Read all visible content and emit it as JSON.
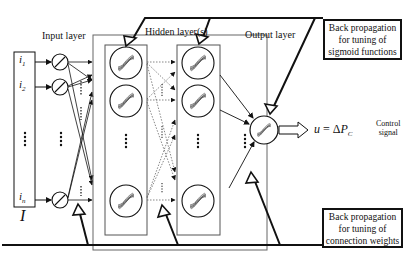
{
  "diagram": {
    "type": "neural-network-architecture",
    "layers": {
      "input_label": "Input layer",
      "hidden_label": "Hidden layer(s)",
      "output_label": "Output layer"
    },
    "inputs": {
      "vector_label": "I",
      "items": [
        {
          "base": "i",
          "sub": "1"
        },
        {
          "base": "i",
          "sub": "2"
        },
        {
          "base": "i",
          "sub": "n"
        }
      ]
    },
    "output": {
      "var": "u",
      "equals": "=",
      "delta": "Δ",
      "P": "P",
      "sub": "C",
      "control_line1": "Control",
      "control_line2": "signal"
    },
    "annotations": {
      "top": {
        "line1": "Back propagation",
        "line2": "for tuning of",
        "line3": "sigmoid functions"
      },
      "bottom": {
        "line1": "Back propagation",
        "line2": "for tuning of",
        "line3": "connection weights"
      }
    },
    "colors": {
      "stroke": "#111111",
      "dotted": "#555555",
      "hidden_box": "#666666",
      "background": "#ffffff"
    }
  }
}
